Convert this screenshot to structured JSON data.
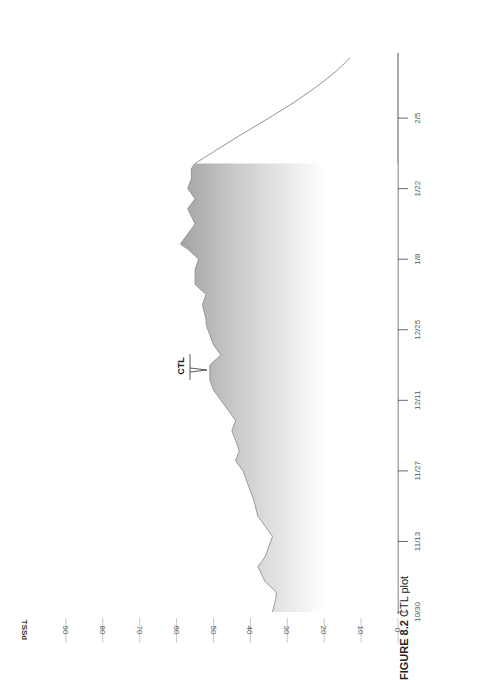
{
  "chart_data": {
    "type": "area",
    "orientation": "rotated 90 degrees counter-clockwise (x-axis runs bottom-to-top on right, y-axis runs right-to-left)",
    "title": "CTL plot",
    "figure_label": "FIGURE 8.2",
    "ylabel": "TSSd",
    "xlabel": "",
    "ylim": [
      0,
      90
    ],
    "y_ticks": [
      0,
      10,
      20,
      30,
      40,
      50,
      60,
      70,
      80,
      90
    ],
    "x_ticks": [
      "10/30",
      "11/13",
      "11/27",
      "12/11",
      "12/25",
      "1/8",
      "1/22",
      "2/5"
    ],
    "annotation": "CTL",
    "grid": false,
    "series": [
      {
        "name": "CTL",
        "style": "filled area with fading gradient",
        "x_days_from_10_30": [
          0,
          3,
          4,
          6,
          9,
          11,
          15,
          17,
          19,
          22,
          24,
          28,
          30,
          32,
          34,
          36,
          38,
          40,
          42,
          44,
          46,
          49,
          51,
          53,
          57,
          58,
          61,
          63,
          65,
          68,
          70,
          72,
          73,
          75,
          77,
          80,
          82,
          84,
          86,
          88,
          89
        ],
        "values": [
          34,
          33,
          33,
          36,
          38,
          36,
          34,
          36,
          38,
          39,
          40,
          42,
          44,
          43,
          44,
          45,
          44,
          46,
          48,
          50,
          51,
          51,
          48,
          50,
          52,
          52,
          53,
          52,
          55,
          55,
          54,
          57,
          59,
          57,
          55,
          57,
          55,
          57,
          56,
          56,
          55
        ]
      },
      {
        "name": "CTL projection (decay)",
        "style": "line",
        "x_days_from_10_30": [
          89,
          95,
          101,
          107,
          110
        ],
        "values": [
          55,
          42,
          28,
          17,
          13
        ]
      }
    ]
  },
  "labels": {
    "y_title": "TSSd",
    "y_ticks": [
      "90",
      "80",
      "70",
      "60",
      "50",
      "40",
      "30",
      "20",
      "10",
      "0"
    ],
    "x_ticks": [
      "10/30",
      "11/13",
      "11/27",
      "12/11",
      "12/25",
      "1/8",
      "1/22",
      "2/5"
    ],
    "annotation": "CTL",
    "caption_fig": "FIGURE 8.2",
    "caption_text": "CTL plot"
  },
  "colors": {
    "fill_dark": "#a6a6a6",
    "fill_light": "#ffffff",
    "axis": "#444444",
    "grid_tick": "#bbbbbb"
  }
}
